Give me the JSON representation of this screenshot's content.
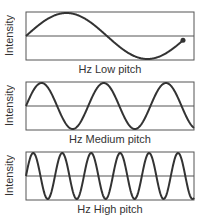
{
  "panels": [
    {
      "ylabel": "Intensity",
      "xlabel": "Hz Low pitch",
      "cycles": 0.97,
      "end_dot": true
    },
    {
      "ylabel": "Intensity",
      "xlabel": "Hz Medium pitch",
      "cycles": 2.7,
      "end_dot": false
    },
    {
      "ylabel": "Intensity",
      "xlabel": "Hz High pitch",
      "cycles": 5.8,
      "end_dot": false
    }
  ],
  "colors": {
    "wave": "#333333",
    "frame": "#555555"
  }
}
